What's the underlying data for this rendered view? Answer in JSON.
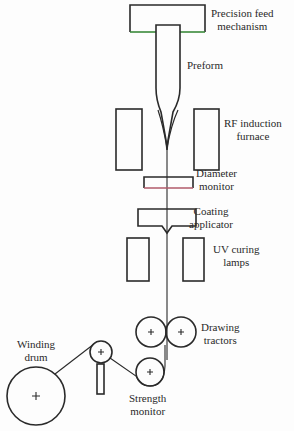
{
  "diagram": {
    "colors": {
      "stroke": "#2a2a2a",
      "feed_bottom_edge": "#3a8a3a",
      "monitor_bottom_edge": "#b05a6a",
      "background": "#fdfdfd"
    },
    "labels": {
      "feed": {
        "line1": "Precision feed",
        "line2": "mechanism"
      },
      "preform": {
        "line1": "Preform"
      },
      "furnace": {
        "line1": "RF induction",
        "line2": "furnace"
      },
      "diameter": {
        "line1": "Diameter",
        "line2": "monitor"
      },
      "coating": {
        "line1": "Coating",
        "line2": "applicator"
      },
      "uv": {
        "line1": "UV curing",
        "line2": "lamps"
      },
      "tractors": {
        "line1": "Drawing",
        "line2": "tractors"
      },
      "winding": {
        "line1": "Winding",
        "line2": "drum"
      },
      "strength": {
        "line1": "Strength",
        "line2": "monitor"
      }
    },
    "components": [
      "Precision feed mechanism",
      "Preform",
      "RF induction furnace",
      "Diameter monitor",
      "Coating applicator",
      "UV curing lamps",
      "Drawing tractors",
      "Strength monitor",
      "Winding drum"
    ],
    "center_mark": "+"
  }
}
